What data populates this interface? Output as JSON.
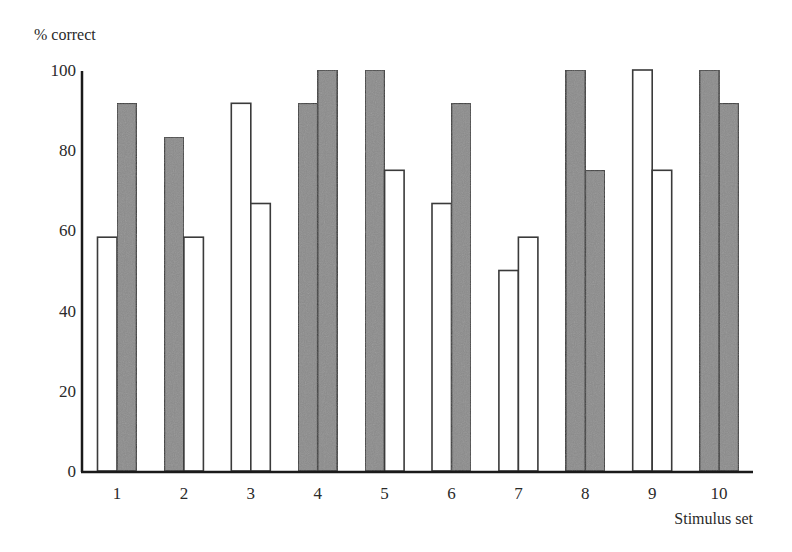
{
  "chart_data": {
    "type": "bar",
    "title": "",
    "xlabel": "Stimulus set",
    "ylabel": "% correct",
    "ylim": [
      0,
      100
    ],
    "yticks": [
      0,
      20,
      40,
      60,
      80,
      100
    ],
    "grid": false,
    "legend": null,
    "categories": [
      "1",
      "2",
      "3",
      "4",
      "5",
      "6",
      "7",
      "8",
      "9",
      "10"
    ],
    "bars_per_category": 2,
    "fill_colors": {
      "filled": "#8c8c8c",
      "open": "#ffffff"
    },
    "series": [
      {
        "name": "first bar",
        "values": [
          58.3,
          83.3,
          91.7,
          91.7,
          100,
          66.7,
          50.0,
          100,
          100,
          100
        ],
        "filled": [
          false,
          true,
          false,
          true,
          true,
          false,
          false,
          true,
          false,
          true
        ]
      },
      {
        "name": "second bar",
        "values": [
          91.7,
          58.3,
          66.7,
          100,
          75.0,
          91.7,
          58.3,
          75.0,
          75.0,
          91.7
        ],
        "filled": [
          true,
          false,
          false,
          true,
          false,
          true,
          false,
          true,
          false,
          true
        ]
      }
    ]
  }
}
